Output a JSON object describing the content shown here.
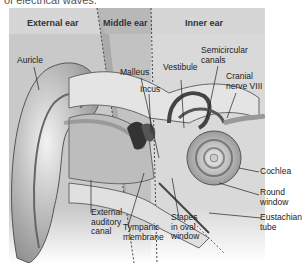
{
  "caption_fragment": "of electrical waves.",
  "sections": {
    "external": "External ear",
    "middle": "Middle ear",
    "inner": "Inner ear"
  },
  "labels": {
    "auricle": "Auricle",
    "malleus": "Malleus",
    "incus": "Incus",
    "vestibule": "Vestibule",
    "semicircular_1": "Semicircular",
    "semicircular_2": "canals",
    "cranial_1": "Cranial",
    "cranial_2": "nerve VIII",
    "cochlea": "Cochlea",
    "round_1": "Round",
    "round_2": "window",
    "eustachian_1": "Eustachian",
    "eustachian_2": "tube",
    "external_canal_1": "External",
    "external_canal_2": "auditory",
    "external_canal_3": "canal",
    "tympanic_1": "Tympanic",
    "tympanic_2": "membrane",
    "stapes_1": "Stapes",
    "stapes_2": "in oval",
    "stapes_3": "window"
  },
  "colors": {
    "header_band": "#d4d4d4",
    "external_zone": "#cfcfcf",
    "middle_zone": "#9a9a9a",
    "inner_zone": "#dcdcdc"
  }
}
